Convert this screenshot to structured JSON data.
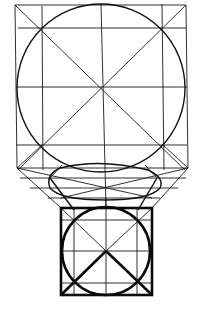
{
  "diagram": {
    "title": "",
    "colors": {
      "stroke": "#111111",
      "background": "#ffffff"
    },
    "top_square": {
      "x1": 15,
      "y1": 5,
      "x2": 186,
      "y2": 145
    },
    "top_circle": {
      "cx": 101,
      "cy": 87,
      "r": 84
    },
    "bottom_square": {
      "x1": 61,
      "y1": 208,
      "x2": 152,
      "y2": 295
    },
    "bottom_circle": {
      "cx": 106,
      "cy": 251,
      "r": 44
    }
  }
}
